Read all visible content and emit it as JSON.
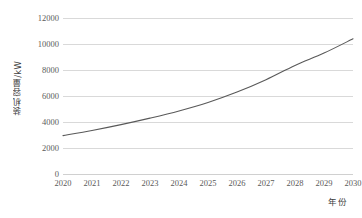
{
  "chart_data": {
    "type": "line",
    "title": "",
    "xlabel": "年份",
    "ylabel": "装机容量/kW",
    "x": [
      2020,
      2021,
      2022,
      2023,
      2024,
      2025,
      2026,
      2027,
      2028,
      2029,
      2030
    ],
    "categories": [
      "2020",
      "2021",
      "2022",
      "2023",
      "2024",
      "2025",
      "2026",
      "2027",
      "2028",
      "2029",
      "2030"
    ],
    "series": [
      {
        "name": "装机容量",
        "values": [
          2950,
          3350,
          3800,
          4300,
          4850,
          5500,
          6300,
          7250,
          8350,
          9300,
          10400
        ]
      }
    ],
    "ylim": [
      0,
      12000
    ],
    "xlim": [
      2020,
      2030
    ],
    "ytick_values": [
      0,
      2000,
      4000,
      6000,
      8000,
      10000,
      12000
    ],
    "yticks": [
      "0",
      "2000",
      "4000",
      "6000",
      "8000",
      "10000",
      "12000"
    ],
    "grid": "horizontal",
    "legend": "none",
    "line_color": "#595959",
    "grid_color": "#d9d9d9",
    "background_color": "#ffffff",
    "text_color": "#5a5a5a"
  }
}
